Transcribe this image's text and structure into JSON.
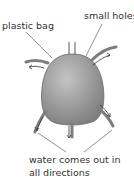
{
  "labels": {
    "plastic_bag": "plastic bag",
    "small_holes": "small holes",
    "water_line1": "water comes out in",
    "water_line2": "all directions"
  },
  "colors": {
    "bag_fill": "#9a9a9a",
    "tube": "#7d7d7d",
    "line": "#444444"
  }
}
